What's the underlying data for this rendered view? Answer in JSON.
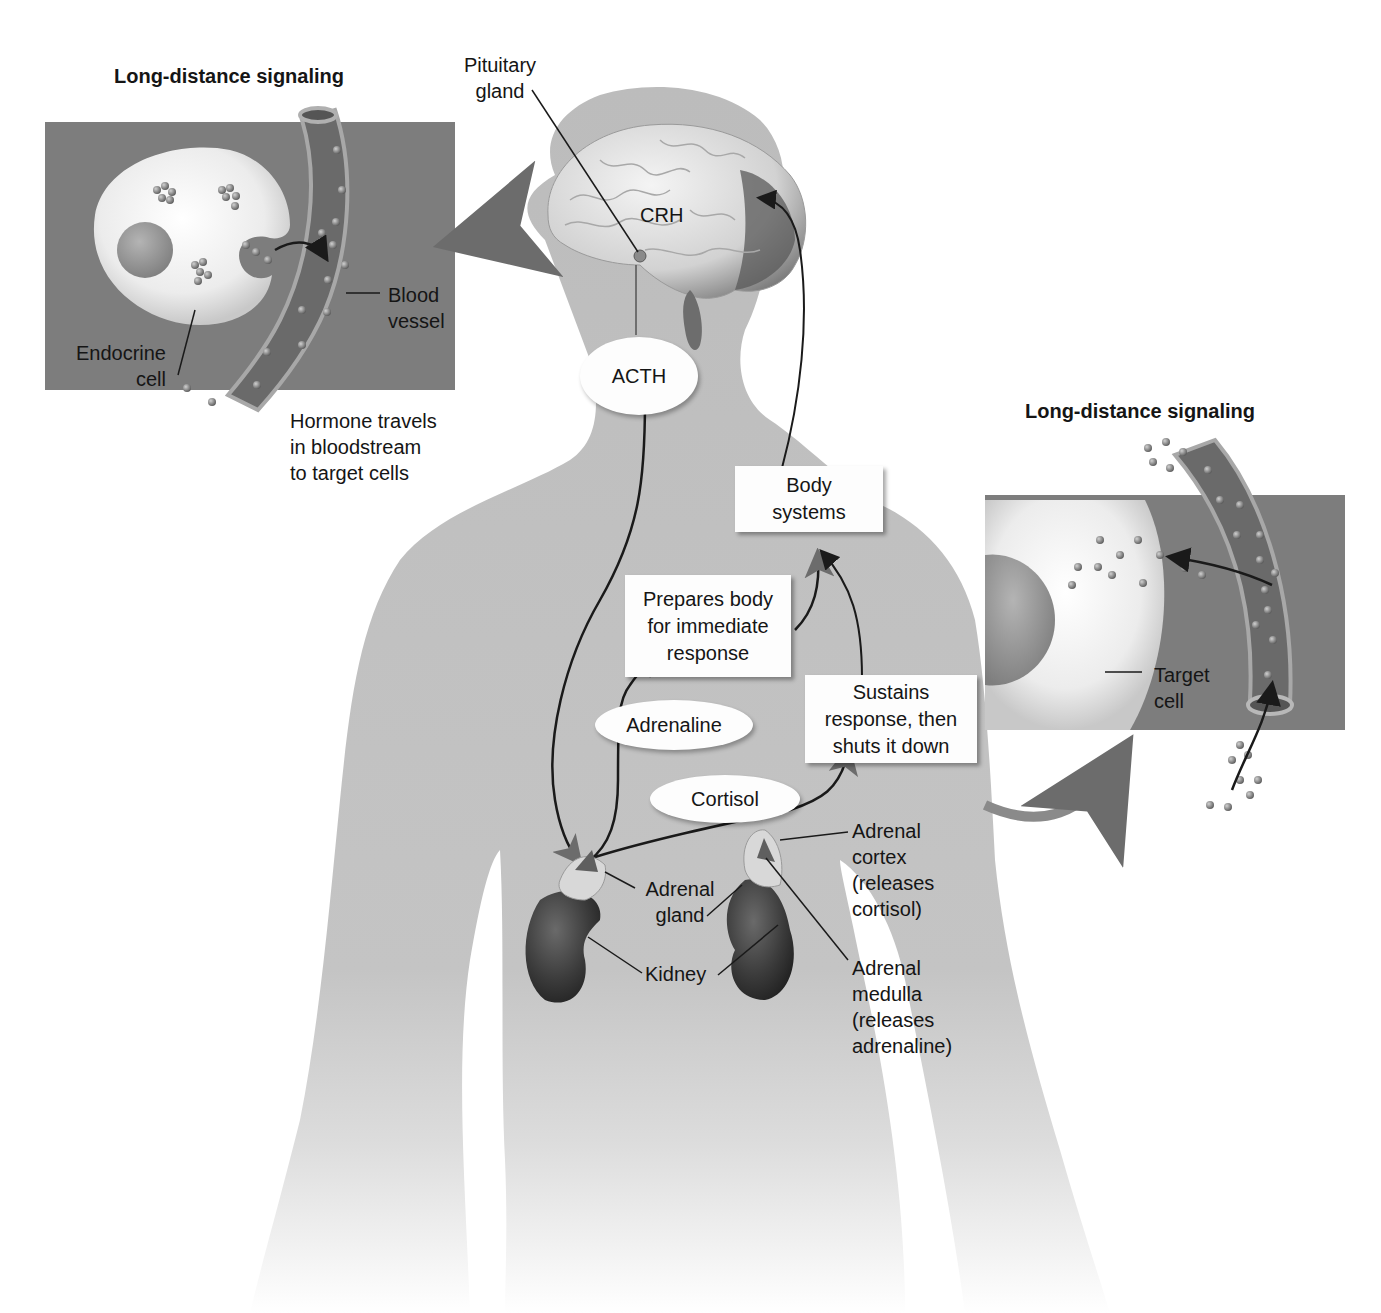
{
  "figure": {
    "colors": {
      "background": "#ffffff",
      "body_silhouette": "#bdbdbd",
      "panel_background": "#7d7d7d",
      "cell": "#efefef",
      "nucleus": "#9a9a9a",
      "vessel": "#6e6e6e",
      "kidney": "#3a3a3a",
      "label_box": "#fdfdfd",
      "arrow": "#1a1a1a"
    }
  },
  "left_panel": {
    "title": "Long-distance signaling",
    "labels": {
      "blood_vessel": [
        "Blood",
        "vessel"
      ],
      "endocrine_cell": [
        "Endocrine",
        "cell"
      ]
    },
    "caption": [
      "Hormone travels",
      "in bloodstream",
      "to target cells"
    ]
  },
  "right_panel": {
    "title": "Long-distance signaling",
    "labels": {
      "target_cell": [
        "Target",
        "cell"
      ]
    }
  },
  "brain": {
    "pituitary_label": [
      "Pituitary",
      "gland"
    ],
    "crh_label": "CRH"
  },
  "hormones": {
    "acth": "ACTH",
    "adrenaline": "Adrenaline",
    "cortisol": "Cortisol"
  },
  "boxes": {
    "body_systems": [
      "Body",
      "systems"
    ],
    "prepares": [
      "Prepares body",
      "for immediate",
      "response"
    ],
    "sustains": [
      "Sustains",
      "response, then",
      "shuts it down"
    ]
  },
  "anatomy_labels": {
    "adrenal_gland": [
      "Adrenal",
      "gland"
    ],
    "kidney": "Kidney",
    "adrenal_cortex": [
      "Adrenal",
      "cortex",
      "(releases",
      "cortisol)"
    ],
    "adrenal_medulla": [
      "Adrenal",
      "medulla",
      "(releases",
      "adrenaline)"
    ]
  }
}
